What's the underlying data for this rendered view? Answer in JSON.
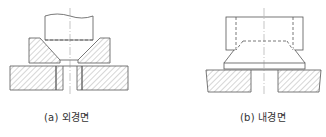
{
  "figures": [
    {
      "id": "a",
      "caption": "(a) 외경면",
      "description": "punch pressing into conical die on base plate (outer surface)"
    },
    {
      "id": "b",
      "caption": "(b) 내경면",
      "description": "ring block over conical frustum on base plate (inner surface)"
    }
  ],
  "colors": {
    "line": "#555555",
    "hatch": "#777777",
    "background": "#ffffff"
  }
}
